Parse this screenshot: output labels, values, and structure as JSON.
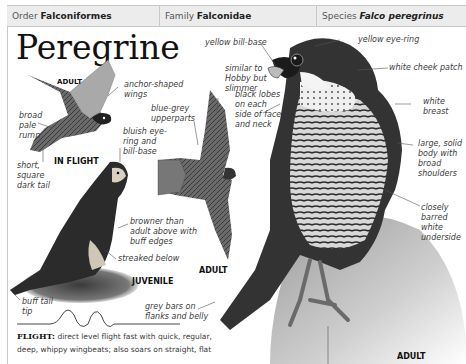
{
  "header": {
    "order_label": "Order",
    "order_value": "Falconiformes",
    "family_label": "Family",
    "family_value": "Falconidae",
    "species_label": "Species",
    "species_value": "Falco peregrinus"
  },
  "title": "Peregrine",
  "captions": {
    "adult_flight_top": "ADULT",
    "in_flight": "IN FLIGHT",
    "juvenile": "JUVENILE",
    "adult_flight_mid": "ADULT",
    "adult_perched": "ADULT"
  },
  "labels": {
    "anchor_wings": [
      "anchor-shaped",
      "wings"
    ],
    "broad_rump": [
      "broad",
      "pale",
      "rump"
    ],
    "short_tail": [
      "short,",
      "square",
      "dark tail"
    ],
    "bluish_eye": [
      "bluish eye-",
      "ring and",
      "bill-base"
    ],
    "blue_grey": [
      "blue-grey",
      "upperparts"
    ],
    "similar_hobby": [
      "similar to",
      "Hobby but",
      "slimmer"
    ],
    "yellow_bill": [
      "yellow bill-base"
    ],
    "yellow_eye": [
      "yellow eye-ring"
    ],
    "black_lobes": [
      "black lobes",
      "on each",
      "side of face",
      "and neck"
    ],
    "white_cheek": [
      "white cheek patch"
    ],
    "white_breast": [
      "white",
      "breast"
    ],
    "large_body": [
      "large, solid",
      "body with",
      "broad",
      "shoulders"
    ],
    "closely_barred": [
      "closely",
      "barred",
      "white",
      "underside"
    ],
    "browner": [
      "browner than",
      "adult above with",
      "buff edges"
    ],
    "streaked": [
      "streaked below"
    ],
    "buff_tail": [
      "buff tail",
      "tip"
    ],
    "grey_bars": [
      "grey bars on",
      "flanks and belly"
    ]
  },
  "flight": {
    "heading": "FLIGHT:",
    "text_line1": "direct level flight fast with quick, regular,",
    "text_line2": "deep, whippy wingbeats; also soars on straight, flat"
  },
  "icons": {
    "flight_pattern": "wavy-flight-path-icon"
  },
  "colors": {
    "header_bg": "#ececec",
    "rule": "#c9c9c9",
    "text": "#3c3c3c"
  }
}
